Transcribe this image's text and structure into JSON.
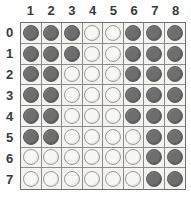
{
  "board": {
    "title": "Reversi board",
    "column_headers": [
      "1",
      "2",
      "3",
      "4",
      "5",
      "6",
      "7",
      "8"
    ],
    "row_headers": [
      "0",
      "1",
      "2",
      "3",
      "4",
      "5",
      "6",
      "7"
    ],
    "colors": {
      "dark_disc": "#6e6e6e",
      "light_disc": "#f7f7f4",
      "cell_background": "#f4f3ef",
      "grid_line": "#8c8c8c",
      "border": "#6f6f6f",
      "label_text": "#3a3a3a",
      "page_background": "#ffffff"
    },
    "legend": {
      "dark_label": "dark",
      "light_label": "light"
    },
    "counts": {
      "dark": 30,
      "light": 34,
      "total": 64
    },
    "grid_size": {
      "rows": 8,
      "columns": 8
    },
    "cells": [
      [
        "dark",
        "dark",
        "dark",
        "light",
        "light",
        "dark",
        "dark",
        "dark"
      ],
      [
        "dark",
        "dark",
        "dark",
        "light",
        "light",
        "dark",
        "dark",
        "dark"
      ],
      [
        "dark",
        "dark",
        "light",
        "light",
        "light",
        "dark",
        "dark",
        "dark"
      ],
      [
        "dark",
        "dark",
        "light",
        "light",
        "light",
        "dark",
        "dark",
        "dark"
      ],
      [
        "dark",
        "dark",
        "light",
        "light",
        "light",
        "dark",
        "dark",
        "dark"
      ],
      [
        "dark",
        "dark",
        "light",
        "light",
        "light",
        "light",
        "dark",
        "dark"
      ],
      [
        "light",
        "light",
        "light",
        "light",
        "light",
        "light",
        "dark",
        "dark"
      ],
      [
        "light",
        "light",
        "light",
        "light",
        "light",
        "light",
        "dark",
        "dark"
      ]
    ]
  }
}
